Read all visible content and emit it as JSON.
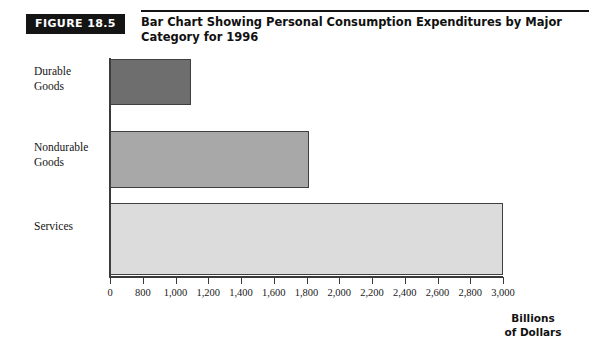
{
  "figure": {
    "badge": "FIGURE 18.5",
    "title": "Bar Chart Showing Personal Consumption Expenditures by Major Category for 1996"
  },
  "chart_data": {
    "type": "bar",
    "orientation": "horizontal",
    "title": "Bar Chart Showing Personal Consumption Expenditures by Major Category for 1996",
    "categories": [
      "Durable Goods",
      "Nondurable Goods",
      "Services"
    ],
    "values": [
      620,
      1520,
      3000
    ],
    "series": [
      {
        "name": "Personal Consumption Expenditures",
        "values": [
          620,
          1520,
          3000
        ]
      }
    ],
    "bar_colors": [
      "#6e6e6e",
      "#a8a8a8",
      "#dcdcdc"
    ],
    "bar_border_color": "#3f3f3f",
    "xlabel": "Billions\nof Dollars",
    "ylabel": "",
    "xlim": [
      0,
      3000
    ],
    "tick_labels": [
      "0",
      "800",
      "1,000",
      "1,200",
      "1,400",
      "1,600",
      "1,800",
      "2,000",
      "2,200",
      "2,400",
      "2,600",
      "2,800",
      "3,000"
    ],
    "grid": false,
    "legend": "none"
  },
  "category_labels": {
    "durable": "Durable\nGoods",
    "nondurable": "Nondurable\nGoods",
    "services": "Services"
  },
  "axis": {
    "units_label": "Billions\nof Dollars"
  }
}
